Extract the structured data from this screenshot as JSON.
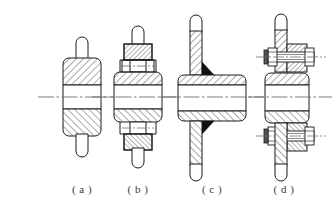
{
  "figure": {
    "title": "",
    "background_color": "#ffffff",
    "line_color": "#1a1a1a",
    "hatch_color": "#2a2a2a",
    "centerline_color": "#6e6e6e",
    "weld_fill_color": "#111111",
    "caption_color": "#3a3a3a",
    "width": 334,
    "height": 217
  },
  "captions": [
    {
      "id": "a",
      "label": "( a )",
      "x": 52,
      "cx": 82
    },
    {
      "id": "b",
      "label": "( b )",
      "x": 108,
      "cx": 138
    },
    {
      "id": "c",
      "label": "( c )",
      "x": 182,
      "cx": 212
    },
    {
      "id": "d",
      "label": "( d )",
      "x": 254,
      "cx": 284
    }
  ],
  "views": [
    {
      "id": "a",
      "name": "plain-hub-section",
      "axis_y": 97,
      "center_x": 82,
      "features": [
        "hub",
        "shaft-bore",
        "rounded-boss-top",
        "rounded-boss-bottom",
        "section-hatching",
        "centerline"
      ]
    },
    {
      "id": "b",
      "name": "pinned-hub-section",
      "axis_y": 97,
      "center_x": 138,
      "features": [
        "hub",
        "shaft-bore",
        "upper-pin",
        "lower-pin",
        "pin-centerlines",
        "section-hatching",
        "centerline"
      ]
    },
    {
      "id": "c",
      "name": "welded-hub-section",
      "axis_y": 97,
      "center_x": 212,
      "features": [
        "hub",
        "shaft-bore",
        "web-plate",
        "weld-fillet-top",
        "weld-fillet-bottom",
        "section-hatching",
        "centerline"
      ]
    },
    {
      "id": "d",
      "name": "bolted-hub-section",
      "axis_y": 97,
      "center_x": 284,
      "features": [
        "hub",
        "shaft-bore",
        "upper-bolt",
        "lower-bolt",
        "hex-nut",
        "washer",
        "bolt-centerlines",
        "section-hatching",
        "centerline"
      ]
    }
  ]
}
